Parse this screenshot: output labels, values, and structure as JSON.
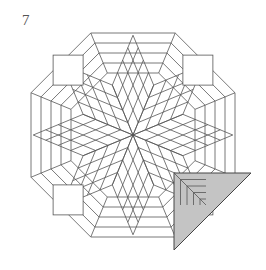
{
  "figure": {
    "number_label": "7",
    "center": [
      133,
      135
    ],
    "colors": {
      "line": "#555555",
      "background": "#ffffff",
      "folded_corner_fill": "#c4c4c4"
    },
    "star": {
      "points": 8,
      "rows_per_diamond": 4,
      "diamond_unit": 13.5
    },
    "borders": {
      "count": 5,
      "inner_half": 62,
      "spacing": 10
    },
    "folded_corner": {
      "position": "bottom-right",
      "vertices": [
        [
          174,
          173
        ],
        [
          251,
          173
        ],
        [
          174,
          250
        ]
      ]
    }
  }
}
